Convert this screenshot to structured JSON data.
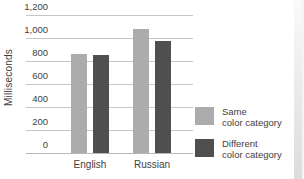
{
  "chart_data": {
    "type": "bar",
    "title": "",
    "ylabel": "Milliseconds",
    "xlabel": "",
    "categories": [
      "English",
      "Russian"
    ],
    "series": [
      {
        "name": "Same color category",
        "color": "#acacac",
        "values": [
          860,
          1075
        ]
      },
      {
        "name": "Different color category",
        "color": "#4f4f4f",
        "values": [
          850,
          975
        ]
      }
    ],
    "ylim": [
      0,
      1200
    ],
    "yticks": [
      {
        "value": 0,
        "label": "0"
      },
      {
        "value": 200,
        "label": "200"
      },
      {
        "value": 400,
        "label": "400"
      },
      {
        "value": 600,
        "label": "600"
      },
      {
        "value": 800,
        "label": "800"
      },
      {
        "value": 1000,
        "label": "1,000"
      },
      {
        "value": 1200,
        "label": "1,200"
      }
    ],
    "grid": true,
    "legend_position": "right-bottom"
  },
  "legend": {
    "items": [
      {
        "id": "same-color-category",
        "color": "#acacac",
        "line1": "Same",
        "line2": "color category"
      },
      {
        "id": "different-color-category",
        "color": "#4f4f4f",
        "line1": "Different",
        "line2": "color category"
      }
    ]
  },
  "colors": {
    "bar_light": "#acacac",
    "bar_dark": "#4f4f4f",
    "gridline": "#c5c5c5",
    "axis_line": "#b9b9b9",
    "text": "#3e3e3e",
    "background": "#ffffff",
    "page_edge": "#dcdcdc"
  }
}
